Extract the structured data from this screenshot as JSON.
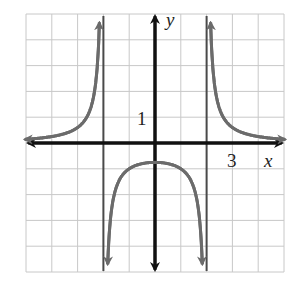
{
  "chart_data": {
    "type": "line",
    "title": "",
    "xlabel": "x",
    "ylabel": "y",
    "xlim": [
      -5,
      5
    ],
    "ylim": [
      -5,
      5
    ],
    "grid": true,
    "tick_labels": {
      "x": [
        "3"
      ],
      "y": [
        "1"
      ]
    },
    "function": "y = 3/(x^2 - 4)",
    "vertical_asymptotes": [
      -2,
      2
    ],
    "horizontal_asymptote": 0,
    "series": [
      {
        "name": "left branch",
        "x": [
          -5,
          -4,
          -3,
          -2.5,
          -2.2
        ],
        "y": [
          0.14,
          0.25,
          0.6,
          1.33,
          3.57
        ]
      },
      {
        "name": "middle branch",
        "x": [
          -1.85,
          -1.5,
          -1,
          0,
          1,
          1.5,
          1.85
        ],
        "y": [
          -5.4,
          -1.71,
          -1.0,
          -0.75,
          -1.0,
          -1.71,
          -5.4
        ]
      },
      {
        "name": "right branch",
        "x": [
          2.2,
          2.5,
          3,
          4,
          5
        ],
        "y": [
          3.57,
          1.33,
          0.6,
          0.25,
          0.14
        ]
      }
    ],
    "colors": {
      "curve": "#6b6b6b",
      "axes": "#111111",
      "asymptote": "#4a4a4a",
      "grid": "#c8c8c8"
    }
  },
  "labels": {
    "x_axis": "x",
    "y_axis": "y",
    "x_tick": "3",
    "y_tick": "1"
  }
}
